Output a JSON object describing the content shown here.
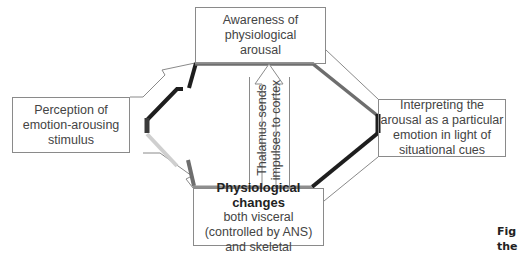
{
  "diagram": {
    "title": "",
    "nodes": {
      "awareness": {
        "lines": [
          "Awareness of",
          "physiological",
          "arousal"
        ]
      },
      "perception": {
        "lines": [
          "Perception of",
          "emotion-arousing",
          "stimulus"
        ]
      },
      "interpreting": {
        "lines": [
          "Interpreting the",
          "arousal as a particular",
          "emotion in light of",
          "situational cues"
        ]
      },
      "physiological": {
        "heading": "Physiological changes",
        "lines": [
          "both visceral",
          "(controlled by ANS)",
          "and skeletal"
        ]
      }
    },
    "connector": {
      "lines": [
        "Thalamus sends",
        "impulses to cortex"
      ]
    },
    "edges": [
      {
        "from": "perception",
        "to": "awareness",
        "type": "arrow"
      },
      {
        "from": "perception",
        "to": "physiological",
        "type": "arrow"
      },
      {
        "from": "physiological",
        "to": "awareness",
        "type": "arrow",
        "label": "Thalamus sends impulses to cortex"
      },
      {
        "from": "awareness",
        "to": "interpreting",
        "type": "arrow"
      },
      {
        "from": "physiological",
        "to": "interpreting",
        "type": "arrow"
      }
    ],
    "colors": {
      "outline": "#8a8a8a",
      "shade_dark": "#1e1e1e",
      "shade_mid": "#6e6e6e",
      "shade_light": "#c8c8c8"
    }
  },
  "caption": {
    "lines": [
      "Fig",
      "the"
    ]
  }
}
